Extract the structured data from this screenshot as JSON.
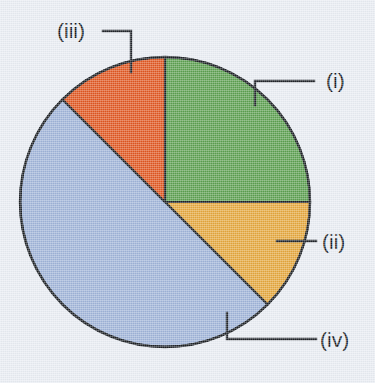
{
  "figure": {
    "background_color": "#e9edf3",
    "outline_color": "#1b1f24",
    "label_color": "#15181c"
  },
  "chart_data": {
    "type": "pie",
    "title": "",
    "subtitle": "",
    "xlabel": "",
    "ylabel": "",
    "legend_position": "callout-labels",
    "grid": false,
    "start_angle_deg": 0,
    "direction": "clockwise",
    "center": {
      "x": 165,
      "y": 202
    },
    "radius": 145,
    "labels": [
      "(i)",
      "(ii)",
      "(iii)",
      "(iv)"
    ],
    "values": [
      25,
      12.5,
      12.5,
      50
    ],
    "angles_deg": [
      90,
      45,
      45,
      180
    ],
    "colors": [
      "#5ba050",
      "#e5a73c",
      "#e0561f",
      "#9fb4d8"
    ],
    "slices": [
      {
        "label": "(i)",
        "value": 25,
        "angle_deg": 90,
        "start_deg": 0,
        "end_deg": 90,
        "color": "#5ba050",
        "color_name": "green"
      },
      {
        "label": "(ii)",
        "value": 12.5,
        "angle_deg": 45,
        "start_deg": 90,
        "end_deg": 135,
        "color": "#e5a73c",
        "color_name": "amber-orange"
      },
      {
        "label": "(iii)",
        "value": 12.5,
        "angle_deg": 45,
        "start_deg": 315,
        "end_deg": 360,
        "color": "#e0561f",
        "color_name": "red-orange"
      },
      {
        "label": "(iv)",
        "value": 50,
        "angle_deg": 180,
        "start_deg": 135,
        "end_deg": 315,
        "color": "#9fb4d8",
        "color_name": "blue"
      }
    ]
  },
  "callouts": {
    "i": {
      "text": "(i)",
      "text_x": 326,
      "text_y": 88
    },
    "ii": {
      "text": "(ii)",
      "text_x": 328,
      "text_y": 251
    },
    "iii": {
      "text": "(iii)",
      "text_x": 57,
      "text_y": 38
    },
    "iv": {
      "text": "(iv)",
      "text_x": 328,
      "text_y": 345
    }
  }
}
